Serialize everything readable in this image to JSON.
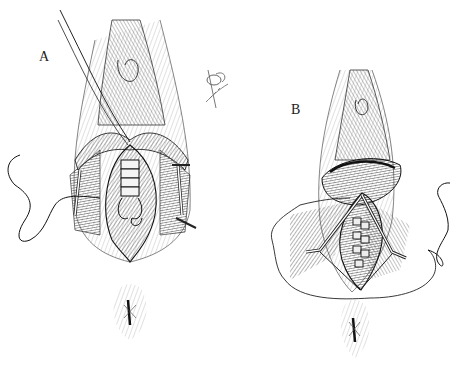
{
  "figure": {
    "panels": [
      {
        "id": "A",
        "label": "A",
        "description": "Surgical illustration: mucosa retracted, layered interrupted sutures placed in midline incision, suture thread looped at lower end, retraction sutures at sides"
      },
      {
        "id": "B",
        "label": "B",
        "description": "Surgical illustration: deeper layer closure with interrupted sutures in elliptical incision, retraction sutures at sides, suture thread draped around field"
      }
    ],
    "signature": "illustrator signature (illegible)",
    "colors": {
      "ink": "#1a1a1a",
      "hatch": "#555555",
      "background": "#ffffff"
    }
  }
}
